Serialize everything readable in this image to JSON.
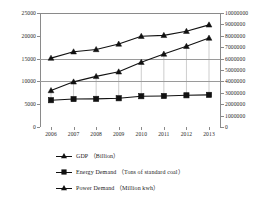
{
  "chart_data": {
    "type": "line",
    "title": "",
    "xlabel": "",
    "ylabel": "",
    "grid": true,
    "legend_position": "bottom-left",
    "categories": [
      "2006",
      "2007",
      "2008",
      "2009",
      "2010",
      "2011",
      "2012",
      "2013"
    ],
    "axes": {
      "left": {
        "label": "",
        "ylim": [
          0,
          25000
        ],
        "ticks": [
          0,
          5000,
          10000,
          15000,
          20000,
          25000
        ],
        "tick_labels": [
          "0",
          "5000",
          "10000",
          "15000",
          "20000",
          "25000"
        ]
      },
      "right": {
        "label": "",
        "ylim": [
          0,
          10000000
        ],
        "ticks": [
          0,
          1000000,
          2000000,
          3000000,
          4000000,
          5000000,
          6000000,
          7000000,
          8000000,
          9000000,
          10000000
        ],
        "tick_labels": [
          "0",
          "1000000",
          "2000000",
          "3000000",
          "4000000",
          "5000000",
          "6000000",
          "7000000",
          "8000000",
          "9000000",
          "10000000"
        ]
      }
    },
    "gridlines_left": [
      10000,
      15000
    ],
    "series": [
      {
        "name": "GDP",
        "legend_label": "GDP （Billion）",
        "unit": "Billion",
        "axis": "left",
        "marker": "triangle",
        "color": "#111111",
        "values": [
          8000,
          9900,
          11100,
          12100,
          14200,
          16000,
          17700,
          19500
        ]
      },
      {
        "name": "Energy Demand",
        "legend_label": "Energy Demand （Tons of standard coal）",
        "unit": "Tons of standard coal",
        "axis": "right",
        "marker": "square",
        "color": "#111111",
        "values": [
          2350000,
          2450000,
          2470000,
          2520000,
          2700000,
          2720000,
          2780000,
          2820000
        ]
      },
      {
        "name": "Power Demand",
        "legend_label": "Power Demand （Million kwh）",
        "unit": "Million kwh",
        "axis": "left",
        "marker": "triangle",
        "color": "#111111",
        "values": [
          15100,
          16500,
          17000,
          18200,
          19900,
          20100,
          21000,
          22400
        ]
      }
    ],
    "drop_lines": true
  },
  "legend": {
    "items": [
      {
        "label": "GDP （Billion）",
        "marker": "triangle"
      },
      {
        "label": "Energy Demand （Tons of standard coal）",
        "marker": "square"
      },
      {
        "label": "Power Demand （Million kwh）",
        "marker": "triangle"
      }
    ]
  }
}
